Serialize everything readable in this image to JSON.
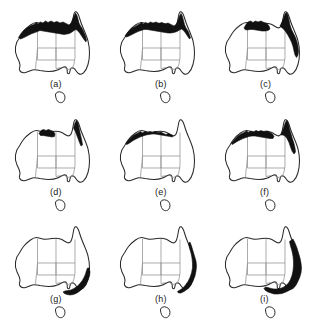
{
  "figure": {
    "type": "map-series",
    "title": "",
    "columns": 3,
    "rows": 3,
    "background_color": "#ffffff",
    "shade_color": "#111111",
    "outline_color": "#2a2a2a",
    "state_border_color": "#8e8e8e"
  },
  "panels": [
    {
      "id": "a",
      "label": "(a)",
      "label_x": 50,
      "label_y": 79,
      "shaded_regions": [
        "northern-kimberley-coast",
        "top-end-coast",
        "gulf-of-carpentaria-coast",
        "cape-york-peninsula",
        "north-queensland-coast"
      ],
      "shade_paths": [
        "M 18.5,37.5 L 21,33.5 L 24,30 L 27.5,27.5 L 31,25.5 L 34,24.5 L 36,22.5 L 38,24 L 40.5,22 L 43,23 L 45.5,21 L 48,22.5 L 51,21 L 54,22.5 L 57,21.5 L 60,23 L 63,22 L 66,23.5 L 69,25 L 71,23 L 72.5,19.5 L 74,16 L 75.5,13 L 77,15.5 L 78,19 L 79,23 L 80.5,26 L 82.5,29 L 84,32.5 L 85.5,36 L 86.5,40 L 86,42 L 84,39.5 L 82,36.5 L 80,33.5 L 78,31 L 76,29.5 L 74,30.5 L 72,32 L 69.5,33.5 L 67,34 L 64,34.5 L 61,34 L 58,33.5 L 55,33 L 52,32.5 L 49,32 L 46,31.5 L 43,31 L 40,30.5 L 37.5,31.5 L 35,32.5 L 32,33.5 L 29,35 L 26,36.5 L 23,38 L 20.5,39 Z"
      ]
    },
    {
      "id": "b",
      "label": "(b)",
      "label_x": 50,
      "label_y": 79,
      "shaded_regions": [
        "kimberley-coast",
        "top-end-coast",
        "gulf-coast",
        "cape-york-peninsula"
      ],
      "shade_paths": [
        "M 20,36 L 23,32 L 26,29 L 29.5,27 L 32,25.5 L 34.5,24 L 36.5,22.5 L 38.5,24 L 40.5,22.5 L 43,23.5 L 45.5,22 L 48,23 L 51,22 L 54,23.5 L 57,22.5 L 60,24 L 63,23 L 66,24.5 L 69,26 L 71.5,24 L 73,20 L 74.5,16 L 76,13.5 L 77.5,16.5 L 78.5,20.5 L 79.5,24.5 L 81,28 L 83,31 L 84.5,34.5 L 85.5,38 L 84.5,39 L 82.5,36 L 80.5,33 L 78.5,30.5 L 76.5,29 L 74.5,30 L 72,31.5 L 69,32.5 L 66,33 L 63,33 L 60,32.5 L 57,32 L 54,31.5 L 51,31 L 48,30.5 L 45,30 L 42,29.5 L 39,29.5 L 36,30.5 L 33,31.5 L 30,33 L 27,34.5 L 24,36 L 21.5,37 Z"
      ]
    },
    {
      "id": "c",
      "label": "(c)",
      "label_x": 50,
      "label_y": 79,
      "shaded_regions": [
        "top-end-coast",
        "cape-york-peninsula",
        "east-queensland-coast"
      ],
      "shade_paths": [
        "M 34,28 L 36,24.5 L 38,22 L 40.5,21 L 43,22.5 L 45.5,21 L 48,22 L 51,21 L 54,22.5 L 57,23.5 L 59,26 L 60,29 L 58,30.5 L 55,31 L 52,31 L 49,30.5 L 46,30 L 43,29.5 L 40,29.5 L 37,30 L 35,29.5 Z",
        "M 70,26 L 72,22 L 73.5,18 L 75,14 L 76.5,12.5 L 78,15.5 L 79,20 L 80,25 L 81.5,29.5 L 83.5,33.5 L 85.5,37.5 L 87,42 L 88,46.5 L 88.5,51 L 88,55 L 86.5,57.5 L 85,55 L 84,51 L 83,46.5 L 81.5,42 L 79.5,38 L 77.5,34.5 L 75.5,31.5 L 73.5,29 L 71.5,27.5 Z"
      ]
    },
    {
      "id": "d",
      "label": "(d)",
      "label_x": 50,
      "label_y": 79,
      "shaded_regions": [
        "top-end-arnhem-coast",
        "cape-york-east-coast"
      ],
      "shade_paths": [
        "M 39,25.5 L 41,22.5 L 43.5,21.5 L 46,22.5 L 48.5,21.5 L 51,22.5 L 53.5,23.5 L 55,26 L 54.5,28.5 L 52,29 L 49,28.5 L 46,28 L 43,27.5 L 40.5,27.5 Z",
        "M 73.5,20 L 75,15 L 76.5,12.5 L 78,15 L 79,19.5 L 80,24.5 L 81,29 L 82,33.5 L 82.5,37 L 81,38 L 79.5,34.5 L 78,30.5 L 76.5,26.5 L 75,23 Z"
      ]
    },
    {
      "id": "e",
      "label": "(e)",
      "label_x": 50,
      "label_y": 79,
      "shaded_regions": [
        "narrow-north-coast-strip"
      ],
      "shade_paths": [
        "M 21,35 L 24,31.5 L 27,28.5 L 30,26.5 L 33,25 L 35.5,23.5 L 37.5,25 L 40,23.5 L 42.5,24.5 L 45,23.5 L 47.5,24.5 L 50,23.5 L 53,24.5 L 56,24 L 58.5,25.5 L 61,26.5 L 63.5,25.5 L 66,26.5 L 68,27.5 L 67.5,29 L 65,28.5 L 62,28 L 59,27.5 L 56,27 L 53,26.5 L 50,26 L 47,26 L 44,26.5 L 41,27 L 38,28 L 35,29 L 32,30.5 L 29,32 L 26,34 L 23,36 L 21.5,36.5 Z"
      ]
    },
    {
      "id": "f",
      "label": "(f)",
      "label_x": 50,
      "label_y": 79,
      "shaded_regions": [
        "kimberley-top-end-coast",
        "cape-york-peninsula-wide"
      ],
      "shade_paths": [
        "M 21.5,35 L 25,31 L 28,28 L 31,26 L 34,24.5 L 36.5,23 L 38.5,24.5 L 41,23 L 43.5,24 L 46,22.5 L 48.5,23.5 L 51,22.5 L 54,24 L 57,23 L 60,24.5 L 62.5,26 L 64,28.5 L 63,30.5 L 60,30.5 L 57,30 L 54,29.5 L 51,29 L 48,28.5 L 45,28 L 42,28 L 39,28.5 L 36,29.5 L 33,30.5 L 30,32 L 27,33.5 L 24,35.5 L 22,36.5 Z",
        "M 71,27 L 72.5,23 L 74,18.5 L 75.5,14 L 77,12.5 L 78.5,16 L 79.5,21 L 81,26 L 82.5,31 L 84,35.5 L 85,40 L 85.5,44 L 84,46 L 82,43 L 80.5,39 L 79,34.5 L 77,30.5 L 75,28 L 73,27 Z"
      ]
    },
    {
      "id": "g",
      "label": "(g)",
      "label_x": 50,
      "label_y": 79,
      "shaded_regions": [
        "south-east-victoria-coast",
        "southern-new-south-wales-coast"
      ],
      "shade_paths": [
        "M 89,53 L 90,57 L 89.5,61 L 88,65 L 86,69 L 83.5,72.5 L 80.5,75.5 L 77,78 L 73.5,79.5 L 70,80 L 67,79.5 L 64.5,78.5 L 63,77 L 65,76 L 68,75.5 L 71,75 L 74,73.5 L 77,71.5 L 79.5,69 L 82,66 L 84,62.5 L 85.5,59 L 86.5,55.5 L 87.5,53 Z"
      ]
    },
    {
      "id": "h",
      "label": "(h)",
      "label_x": 50,
      "label_y": 79,
      "shaded_regions": [
        "east-coast-queensland-to-victoria"
      ],
      "shade_paths": [
        "M 85,27 L 86.5,31 L 88,36 L 89.5,41 L 91,46 L 91.5,51 L 91,56 L 90,61 L 88,66 L 85.5,70.5 L 82.5,74 L 79,76.5 L 76,78 L 73.5,78 L 72.5,76.5 L 75,75 L 78,73 L 80.5,70 L 83,66.5 L 85,62.5 L 86.5,58 L 87.5,53 L 87.5,48 L 87,43 L 86,38 L 84.5,33 L 83.5,28.5 Z"
      ]
    },
    {
      "id": "i",
      "label": "(i)",
      "label_x": 50,
      "label_y": 79,
      "shaded_regions": [
        "east-coast-broad",
        "south-east-coast-broad",
        "south-australia-gulf"
      ],
      "shade_paths": [
        "M 83,24 L 85,28 L 87,33 L 88.5,38 L 90,43 L 91,48 L 91.5,53 L 91,58 L 89.5,63 L 87,68 L 84,72 L 80,75 L 76,77 L 72,78.5 L 68,79 L 64,79 L 61,78 L 58,77 L 55.5,75.5 L 54,73.5 L 55.5,72 L 58,72.5 L 61,73.5 L 64,74 L 67,74 L 70,73.5 L 73,72.5 L 76,70.5 L 78.5,68 L 80.5,64.5 L 82,60.5 L 83,56 L 83.5,51 L 83.5,46 L 83,41 L 82,36 L 80.5,31 L 79.5,26.5 Z"
      ]
    }
  ],
  "map_geometry": {
    "coast_path": "M 20,37 C 17.5,40 16,43.5 15.5,47 C 15,50.5 15.5,54 17,57 C 18.5,60 20,62.5 20,65 C 20,67 19,68.5 19.5,70 C 20.5,72.5 23,73 25.5,72.5 C 28,72 30,70.5 32.5,70 C 35,69.5 37.5,70 40,70.5 C 43,71 46,71.5 49,71.5 C 52,71.5 55,71 57.5,70 C 60,69 62,67.5 64,67 C 65.5,66.6 66.5,67.5 67,69 C 67.5,70.5 67,72 67.5,73 C 68,74 69,74 69.5,73 C 70,71.5 70,69.5 71,68.5 C 72,67.5 73.5,68 74.5,69 C 76,70.5 77,72.5 78.5,73.5 C 80,74.5 82,74.5 83.5,73 C 85.5,71 87,68 88,64.5 C 89,61 89.5,57 89.5,53 C 89.5,49 89,45 88,41 C 87,37 85.5,33.5 84,30 C 82.5,26.5 81,23 80,19.5 C 79,16 78,13 76.5,12 C 75,11 74,13 73.5,16 C 73,19 72.5,22.5 71.5,25 C 70.5,27.5 69,28.5 67,27.5 C 65,26.5 63,25 60.5,24 C 58,23 55,23 52,23.5 C 49,24 46,24.5 43,24 C 40.5,23.6 38.5,22.5 36.5,22.5 C 34.5,22.5 32.5,23.5 30.5,25 C 28,26.8 25.5,29 23.5,31.5 C 22,33.4 21,35.2 20,37 Z",
    "tasmania_path": "M 58,92 C 56.5,92.5 55.5,93.5 55.5,95 C 55.5,96.5 56,98 56.5,99.5 C 57,101 58,102 59.5,102.5 C 61,103 62.5,102.5 63.5,101.5 C 64.5,100.5 65,99 65,97.5 C 65,96 64.5,94.5 63.5,93.5 C 62.5,92.5 61,92 59.5,91.8 Z",
    "state_borders": [
      "M 37.5,24 L 37.5,48 L 36.8,56 L 36,63 L 35.5,69.5",
      "M 37.5,48 L 56,48 L 56,24",
      "M 37.5,48 L 37.5,60 L 56,60 L 56,48",
      "M 56,60 L 56,48 L 75,48",
      "M 56,60 L 56,68.5 L 62,67.5",
      "M 75,24.5 L 75,48 L 75,58 L 74,64 L 72,69",
      "M 56,60 L 75,60",
      "M 63,66.5 L 68,69.5 L 74,68"
    ]
  }
}
